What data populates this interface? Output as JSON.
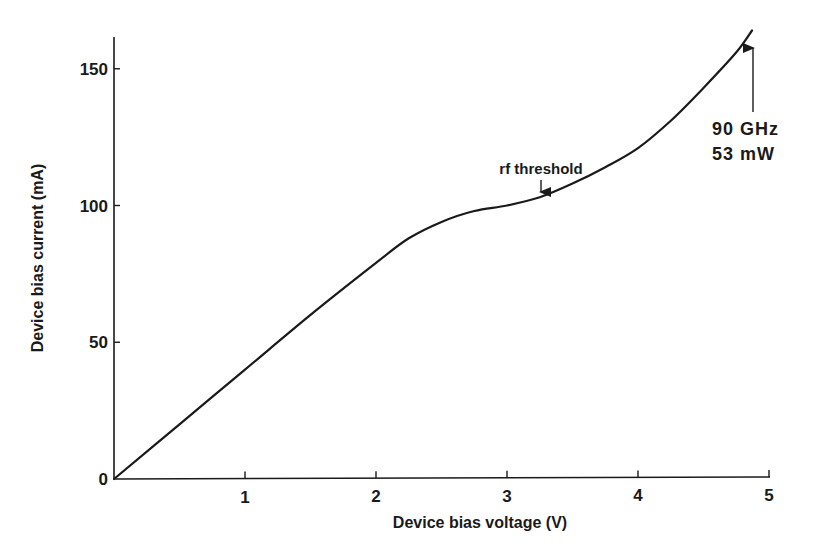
{
  "chart_data": {
    "type": "line",
    "title": "",
    "xlabel": "Device bias voltage (V)",
    "ylabel": "Device bias current (mA)",
    "xlim": [
      0,
      5
    ],
    "ylim": [
      0,
      165
    ],
    "x_ticks": [
      1,
      2,
      3,
      4,
      5
    ],
    "x_tick_labels": [
      "1",
      "2",
      "3",
      "4",
      "5"
    ],
    "y_ticks": [
      0,
      50,
      100,
      150
    ],
    "y_tick_labels": [
      "0",
      "50",
      "100",
      "150"
    ],
    "grid": false,
    "legend": null,
    "series": [
      {
        "name": "I-V characteristic",
        "x": [
          0,
          0.5,
          1.0,
          1.5,
          2.0,
          2.25,
          2.5,
          2.75,
          3.0,
          3.25,
          3.5,
          3.75,
          4.0,
          4.25,
          4.5,
          4.75,
          4.87
        ],
        "y": [
          0,
          20,
          40,
          60,
          79,
          88,
          94,
          98,
          100,
          103,
          108,
          114,
          121,
          131,
          143,
          156,
          164
        ]
      }
    ],
    "annotations": [
      {
        "text": "rf threshold",
        "x": 3.25,
        "y": 103,
        "arrow": "down"
      },
      {
        "text": "90 GHz",
        "x": 4.87,
        "y": 164,
        "arrow": "up"
      },
      {
        "text": "53 mW",
        "x": 4.87,
        "y": 164
      }
    ]
  },
  "labels": {
    "xlabel": "Device bias voltage (V)",
    "ylabel": "Device bias current (mA)",
    "rf_threshold": "rf threshold",
    "freq": "90 GHz",
    "power": "53 mW"
  }
}
